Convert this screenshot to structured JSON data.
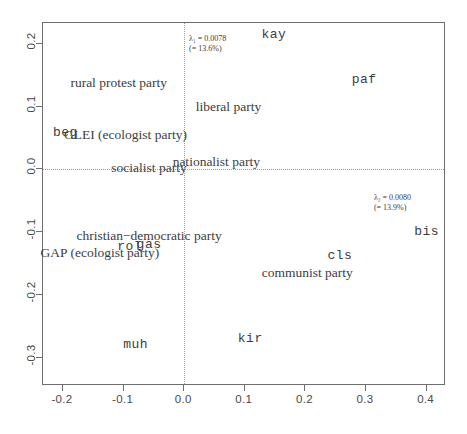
{
  "chart_data": {
    "type": "scatter",
    "title": "",
    "subtitle": "",
    "xlabel": "",
    "ylabel": "",
    "xlim": [
      -0.233,
      0.432
    ],
    "ylim": [
      -0.345,
      0.233
    ],
    "grid": false,
    "legend": null,
    "xticks": [
      "-0.2",
      "-0.1",
      "0.0",
      "0.1",
      "0.2",
      "0.3",
      "0.4"
    ],
    "xtick_values": [
      -0.2,
      -0.1,
      0.0,
      0.1,
      0.2,
      0.3,
      0.4
    ],
    "yticks": [
      "0.2",
      "0.1",
      "0.0",
      "-0.1",
      "-0.2",
      "-0.3"
    ],
    "ytick_values": [
      0.2,
      0.1,
      0.0,
      -0.1,
      -0.2,
      -0.3
    ],
    "reference_lines": {
      "x": 0.0,
      "y": 0.0,
      "style": "dotted"
    },
    "annotations": [
      {
        "name": "lambda-1",
        "line1": "λ₁ = 0.0078",
        "line2": "(= 13.6%)",
        "symbol": "λ",
        "subscript": "1",
        "value": 0.0078,
        "percent": "13.6%",
        "x": 0.008,
        "y": 0.215
      },
      {
        "name": "lambda-2",
        "line1": "λ₂ = 0.0080",
        "line2": "(= 13.9%)",
        "symbol": "λ",
        "subscript": "2",
        "value": 0.008,
        "percent": "13.9%",
        "x": 0.313,
        "y": -0.038
      }
    ],
    "points": [
      {
        "label": "kay",
        "x": 0.148,
        "y": 0.216,
        "style": "mono"
      },
      {
        "label": "rural protest party",
        "x": -0.108,
        "y": 0.138,
        "style": "serif"
      },
      {
        "label": "paf",
        "x": 0.297,
        "y": 0.144,
        "style": "mono"
      },
      {
        "label": "liberal party",
        "x": 0.073,
        "y": 0.1,
        "style": "serif"
      },
      {
        "label": "beg",
        "x": -0.196,
        "y": 0.059,
        "style": "mono"
      },
      {
        "label": "GLEI (ecologist party)",
        "x": -0.097,
        "y": 0.054,
        "style": "serif"
      },
      {
        "label": "socialist party",
        "x": -0.058,
        "y": 0.002,
        "style": "serif"
      },
      {
        "label": "nationalist party",
        "x": 0.053,
        "y": 0.012,
        "style": "serif"
      },
      {
        "label": "bis",
        "x": 0.4,
        "y": -0.098,
        "style": "mono"
      },
      {
        "label": "christian−democratic party",
        "x": -0.058,
        "y": -0.106,
        "style": "serif"
      },
      {
        "label": "rol",
        "x": -0.09,
        "y": -0.122,
        "style": "mono"
      },
      {
        "label": "gas",
        "x": -0.058,
        "y": -0.119,
        "style": "mono"
      },
      {
        "label": "GAP (ecologist party)",
        "x": -0.139,
        "y": -0.134,
        "style": "serif"
      },
      {
        "label": "cls",
        "x": 0.257,
        "y": -0.137,
        "style": "mono"
      },
      {
        "label": "communist party",
        "x": 0.203,
        "y": -0.165,
        "style": "serif"
      },
      {
        "label": "kir",
        "x": 0.109,
        "y": -0.268,
        "style": "mono"
      },
      {
        "label": "muh",
        "x": -0.08,
        "y": -0.278,
        "style": "mono"
      }
    ]
  }
}
